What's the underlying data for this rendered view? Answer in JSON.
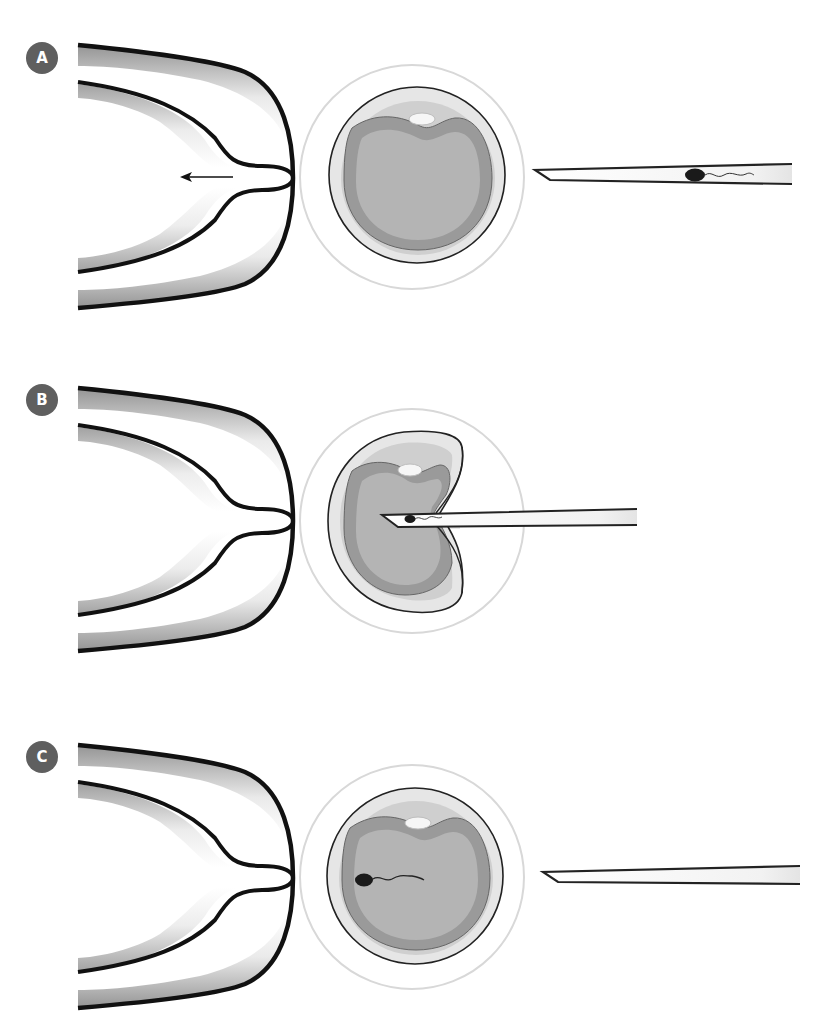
{
  "figure": {
    "panels": [
      {
        "label": "A",
        "step": "oocyte held by holding pipette; injection pipette with sperm approaches"
      },
      {
        "label": "B",
        "step": "injection pipette penetrates zona and oolemma, delivering sperm into cytoplasm"
      },
      {
        "label": "C",
        "step": "sperm inside oocyte; injection pipette withdrawn"
      }
    ],
    "elements": {
      "holding_pipette": "holding pipette",
      "oocyte": "oocyte",
      "zona_pellucida": "zona pellucida",
      "polar_body": "polar body",
      "injection_pipette": "injection pipette",
      "sperm": "sperm",
      "suction_arrow": "suction arrow"
    },
    "colors": {
      "badge": "#5f5f5f",
      "outline": "#111111",
      "zona": "#e6e6e6",
      "perivitelline": "#cfcfcf",
      "cortex": "#9a9a9a",
      "cytoplasm": "#b4b4b4",
      "polar_body": "#f4f4f4"
    }
  }
}
